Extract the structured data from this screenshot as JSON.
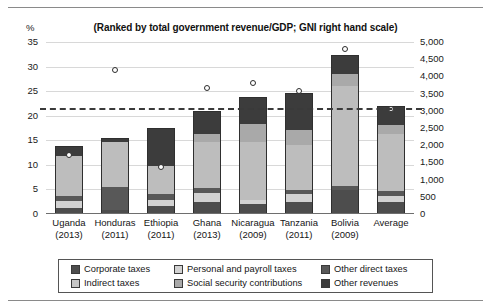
{
  "chart_data": {
    "type": "bar",
    "title": "(Ranked by total government revenue/GDP; GNI right hand scale)",
    "xlabel": "",
    "ylabel": "%",
    "ylim": [
      0,
      35
    ],
    "y2lim": [
      0,
      5000
    ],
    "grid": true,
    "legend_position": "bottom",
    "stacked": true,
    "categories": [
      "Uganda",
      "Honduras",
      "Ethiopia",
      "Ghana",
      "Nicaragua",
      "Tanzania",
      "Bolivia",
      "Average"
    ],
    "category_years": [
      "(2013)",
      "(2011)",
      "(2011)",
      "(2013)",
      "(2009)",
      "(2011)",
      "(2009)",
      ""
    ],
    "yticks": [
      "0",
      "5",
      "10",
      "15",
      "20",
      "25",
      "30",
      "35"
    ],
    "y2ticks": [
      "0",
      "500",
      "1,000",
      "1,500",
      "2,000",
      "2,500",
      "3,000",
      "3,500",
      "4,000",
      "4,500",
      "5,000"
    ],
    "series": [
      {
        "name": "Corporate taxes",
        "color": "#4d4d4d",
        "values": [
          1.0,
          0.6,
          1.5,
          2.2,
          1.9,
          2.3,
          4.6,
          2.3
        ]
      },
      {
        "name": "Indirect taxes",
        "color": "#d2d2d2",
        "values": [
          1.4,
          0.0,
          1.1,
          1.8,
          0.7,
          1.5,
          0.0,
          1.2
        ]
      },
      {
        "name": "Other direct taxes",
        "color": "#585858",
        "values": [
          1.0,
          4.6,
          1.2,
          1.0,
          0.0,
          0.9,
          0.9,
          1.0
        ]
      },
      {
        "name": "Personal and payroll taxes",
        "color": "#bdbdbd",
        "values": [
          8.2,
          9.3,
          5.7,
          9.5,
          11.9,
          9.2,
          20.3,
          11.5
        ]
      },
      {
        "name": "Social security contributions",
        "color": "#a9a9a9",
        "values": [
          0.0,
          0.0,
          0.0,
          1.5,
          3.6,
          3.0,
          2.4,
          2.0
        ]
      },
      {
        "name": "Other revenues",
        "color": "#3c3c3c",
        "values": [
          1.8,
          0.6,
          7.6,
          4.6,
          5.4,
          7.3,
          3.7,
          3.6
        ]
      }
    ],
    "totals": [
      13.4,
      15.1,
      17.1,
      20.6,
      23.5,
      24.2,
      31.9,
      21.6
    ],
    "gni_marker_label": "GNI per capita",
    "gni_values": [
      1720,
      4200,
      1360,
      3650,
      3800,
      3580,
      4800,
      3060
    ],
    "reference_line": {
      "value": 21.5,
      "style": "dashed"
    }
  },
  "legend": {
    "items": [
      {
        "label": "Corporate taxes",
        "color": "#4d4d4d"
      },
      {
        "label": "Personal and payroll taxes",
        "color": "#d2d2d2"
      },
      {
        "label": "Other direct taxes",
        "color": "#585858"
      },
      {
        "label": "Indirect  taxes",
        "color": "#c6c6c6"
      },
      {
        "label": "Social security contributions",
        "color": "#a9a9a9"
      },
      {
        "label": "Other revenues",
        "color": "#3c3c3c"
      }
    ]
  }
}
